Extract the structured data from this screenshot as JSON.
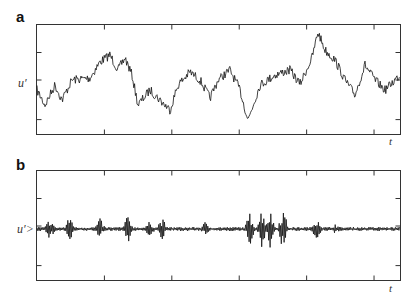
{
  "chart_data": [
    {
      "panel": "a",
      "type": "line",
      "title": "",
      "ylabel": "u'",
      "xlabel": "t",
      "grid": false,
      "x_ticks": 6,
      "y_ticks": 3,
      "series": [
        {
          "name": "u'",
          "description": "large-amplitude low-frequency fluctuating velocity signal"
        }
      ]
    },
    {
      "panel": "b",
      "type": "line",
      "title": "",
      "ylabel": "u'>",
      "xlabel": "t",
      "grid": false,
      "x_ticks": 6,
      "y_ticks": 3,
      "series": [
        {
          "name": "u'>",
          "description": "high-pass filtered signal, intermittent bursts around zero"
        }
      ]
    }
  ],
  "panels": {
    "a": {
      "letter": "a",
      "ylabel": "u′",
      "xlabel": "t"
    },
    "b": {
      "letter": "b",
      "ylabel": "u′>",
      "xlabel": "t"
    }
  }
}
